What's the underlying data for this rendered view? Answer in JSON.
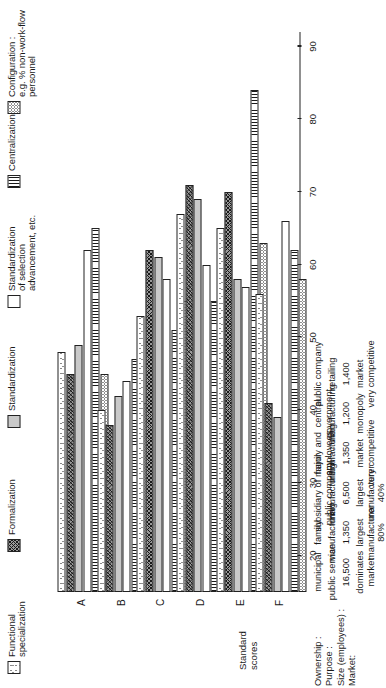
{
  "figure": {
    "axis_label": "Standard\nscores",
    "y_ticks": [
      90,
      80,
      70,
      60,
      50,
      40,
      30,
      20
    ],
    "y_min": 15,
    "y_max": 92
  },
  "legend": [
    {
      "key": "functional_specialization",
      "label": "Functional\nspecialization",
      "pattern": "speck"
    },
    {
      "key": "formalization",
      "label": "Formalization",
      "pattern": "cross"
    },
    {
      "key": "standardization",
      "label": "Standardization",
      "pattern": "grey"
    },
    {
      "key": "standardization_selection",
      "label": "Standardization\nof selection\nadvancement, etc.",
      "pattern": "white"
    },
    {
      "key": "centralization",
      "label": "Centralization",
      "pattern": "vert"
    },
    {
      "key": "configuration",
      "label": "Configuration :\ne.g. % non-work-flow\npersonnel",
      "pattern": "dots"
    }
  ],
  "row_labels": [
    "Ownership :",
    "Purpose :",
    "Size (employees) :",
    "Market:"
  ],
  "chart_data": {
    "type": "bar",
    "title": "",
    "xlabel": "",
    "ylabel": "Standard scores",
    "ylim": [
      15,
      92
    ],
    "grid": false,
    "legend_position": "top",
    "categories": [
      "A",
      "B",
      "C",
      "D",
      "E",
      "F"
    ],
    "org_profiles": [
      {
        "code": "A",
        "ownership": "municipal",
        "purpose": "public service",
        "size": "16,500",
        "market": "dominates\nmarket"
      },
      {
        "code": "B",
        "ownership": "family",
        "purpose": "manufacturing",
        "size": "1,350",
        "market": "largest\nmanufacturer\n80%"
      },
      {
        "code": "C",
        "ownership": "subsidiary of major\npublic company",
        "purpose": "manufacturing",
        "size": "6,500",
        "market": "largest\nmanufacturer\n40%"
      },
      {
        "code": "D",
        "ownership": "family and\nemployees",
        "purpose": "manufacturing",
        "size": "1,350",
        "market": "market\nvery competitive"
      },
      {
        "code": "E",
        "ownership": "central\ngovernment",
        "purpose": "manufacturing",
        "size": "1,200",
        "market": "monopoly"
      },
      {
        "code": "F",
        "ownership": "public company",
        "purpose": "retailing",
        "size": "1,400",
        "market": "market\nvery competitive"
      }
    ],
    "series": [
      {
        "name": "Functional specialization",
        "pattern": "speck",
        "values": [
          48,
          40,
          53,
          67,
          65,
          56
        ]
      },
      {
        "name": "Formalization",
        "pattern": "cross",
        "values": [
          45,
          38,
          62,
          71,
          70,
          41
        ]
      },
      {
        "name": "Standardization",
        "pattern": "grey",
        "values": [
          49,
          42,
          61,
          69,
          58,
          39
        ]
      },
      {
        "name": "Standardization of selection, advancement, etc.",
        "pattern": "white",
        "values": [
          62,
          44,
          58,
          60,
          57,
          66
        ]
      },
      {
        "name": "Centralization",
        "pattern": "vert",
        "values": [
          65,
          47,
          51,
          55,
          84,
          62
        ]
      },
      {
        "name": "Configuration",
        "pattern": "dots",
        "values": [
          45,
          41,
          55,
          61,
          63,
          58
        ]
      }
    ]
  }
}
